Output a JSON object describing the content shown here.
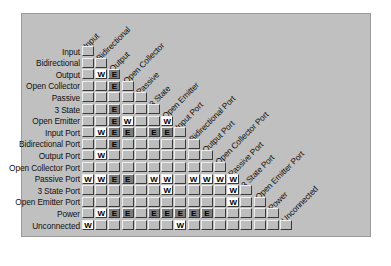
{
  "panel": {
    "title": "ERC Connection Matrix",
    "background_color": "#c0c0c0",
    "cell_colors": {
      "none": "#bdbdbd",
      "warning": "#ffffff",
      "error": "#7d7d7d"
    }
  },
  "caption": "",
  "legend": {
    "warning_symbol": "W",
    "error_symbol": "E",
    "none_symbol": ""
  },
  "chart_data": {
    "type": "heatmap",
    "xlabel": "",
    "ylabel": "",
    "grid": true,
    "legend_position": "none",
    "categories": [
      "Input",
      "Bidirectional",
      "Output",
      "Open Collector",
      "Passive",
      "3 State",
      "Open Emitter",
      "Input Port",
      "Bidirectional Port",
      "Output Port",
      "Open Collector Port",
      "Passive Port",
      "3 State Port",
      "Open Emitter Port",
      "Power",
      "Unconnected"
    ],
    "row_labels": [
      "Input",
      "Bidirectional",
      "Output",
      "Open Collector",
      "Passive",
      "3 State",
      "Open Emitter",
      "Input Port",
      "Bidirectional Port",
      "Output Port",
      "Open Collector Port",
      "Passive Port",
      "3 State Port",
      "Open Emitter Port",
      "Power",
      "Unconnected"
    ],
    "col_labels": [
      "Input",
      "Bidirectional",
      "Output",
      "Open Collector",
      "Passive",
      "3 State",
      "Open Emitter",
      "Input Port",
      "Bidirectional Port",
      "Output Port",
      "Open Collector Port",
      "Passive Port",
      "3 State Port",
      "Open Emitter Port",
      "Power",
      "Unconnected"
    ],
    "values": [
      [
        ""
      ],
      [
        "",
        ""
      ],
      [
        "",
        "W",
        "E"
      ],
      [
        "",
        "",
        "E",
        ""
      ],
      [
        "",
        "",
        "",
        "",
        ""
      ],
      [
        "",
        "",
        "E",
        "",
        "",
        ""
      ],
      [
        "",
        "",
        "E",
        "W",
        "",
        "",
        "W"
      ],
      [
        "",
        "W",
        "E",
        "E",
        "",
        "E",
        "E",
        ""
      ],
      [
        "",
        "",
        "E",
        "",
        "",
        "",
        "",
        "",
        ""
      ],
      [
        "",
        "W",
        "",
        "",
        "",
        "",
        "",
        "",
        "",
        ""
      ],
      [
        "",
        "",
        "",
        "",
        "",
        "",
        "",
        "",
        "",
        "",
        ""
      ],
      [
        "W",
        "W",
        "E",
        "E",
        "",
        "W",
        "W",
        "",
        "W",
        "W",
        "W",
        "W"
      ],
      [
        "",
        "",
        "",
        "",
        "",
        "",
        "W",
        "",
        "",
        "",
        "",
        "W",
        ""
      ],
      [
        "",
        "",
        "",
        "",
        "",
        "",
        "",
        "",
        "",
        "",
        "",
        "W",
        "",
        ""
      ],
      [
        "",
        "W",
        "E",
        "E",
        "",
        "E",
        "E",
        "E",
        "E",
        "E",
        "",
        "",
        "",
        "",
        ""
      ],
      [
        "W",
        "",
        "",
        "",
        "",
        "",
        "",
        "W",
        "",
        "",
        "",
        "",
        "",
        "",
        "",
        ""
      ]
    ]
  }
}
